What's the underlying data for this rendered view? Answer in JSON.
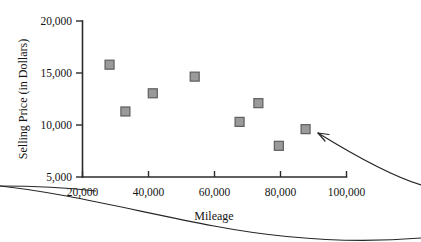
{
  "chart_data": {
    "type": "scatter",
    "title": "",
    "xlabel": "Mileage",
    "ylabel": "Selling Price (in Dollars)",
    "xlim": [
      20000,
      100000
    ],
    "ylim": [
      5000,
      20000
    ],
    "grid": false,
    "legend": "none",
    "x_ticks": [
      "20,000",
      "40,000",
      "60,000",
      "80,000",
      "100,000"
    ],
    "x_tick_values": [
      20000,
      40000,
      60000,
      80000,
      100000
    ],
    "y_ticks": [
      "20,000",
      "15,000",
      "10,000",
      "5,000"
    ],
    "y_tick_values": [
      20000,
      15000,
      10000,
      5000
    ],
    "marker_shape": "square",
    "marker_color": "#9a9a9a",
    "marker_edge_color": "#5e5e5e",
    "points": [
      {
        "x": 28200,
        "y": 15800
      },
      {
        "x": 33000,
        "y": 11300
      },
      {
        "x": 41300,
        "y": 13050
      },
      {
        "x": 54000,
        "y": 14650
      },
      {
        "x": 67600,
        "y": 10300
      },
      {
        "x": 73300,
        "y": 12100
      },
      {
        "x": 79500,
        "y": 8000
      },
      {
        "x": 87600,
        "y": 9600
      }
    ],
    "annotations": [
      {
        "name": "outlier-arrow",
        "text": "",
        "points_to": {
          "x": 87600,
          "y": 9600
        }
      }
    ]
  },
  "axis": {
    "y_label": "Selling Price (in Dollars)",
    "x_label": "Mileage",
    "y_tick_labels": [
      "20,000",
      "15,000",
      "10,000",
      "5,000"
    ],
    "x_tick_labels": [
      "20,000",
      "40,000",
      "60,000",
      "80,000",
      "100,000"
    ]
  },
  "colors": {
    "marker_fill": "#9a9a9a",
    "marker_stroke": "#5e5e5e",
    "axis": "#2b2b2b",
    "text": "#141414",
    "background": "#ffffff"
  }
}
